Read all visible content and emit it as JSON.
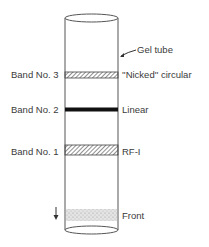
{
  "diagram": {
    "tube_label": "Gel tube",
    "bands": [
      {
        "name": "Band No. 3",
        "form": "''Nicked'' circular",
        "pattern": "hatched"
      },
      {
        "name": "Band No. 2",
        "form": "Linear",
        "pattern": "solid"
      },
      {
        "name": "Band No. 1",
        "form": "RF-I",
        "pattern": "hatched"
      }
    ],
    "front_label": "Front",
    "colors": {
      "line": "#555555",
      "band_solid": "#111111",
      "hatch": "#444444",
      "stipple": "#bbbbbb"
    }
  }
}
